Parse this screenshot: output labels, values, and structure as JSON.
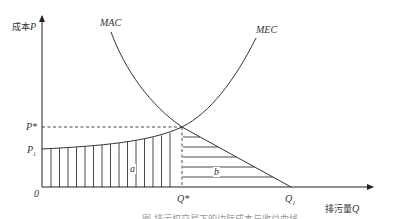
{
  "diagram": {
    "type": "economics-curves",
    "y_axis": {
      "label_cn": "成本",
      "label_var": "P"
    },
    "x_axis": {
      "label_cn": "排污量",
      "label_var": "Q"
    },
    "curves": [
      {
        "name": "MAC",
        "description": "marginal abatement cost, downward sloping"
      },
      {
        "name": "MEC",
        "description": "marginal external cost, upward sloping"
      }
    ],
    "points": {
      "origin": "0",
      "p_star": "P*",
      "p_one": "P",
      "p_one_sub": "1",
      "q_star": "Q*",
      "q_one": "Q",
      "q_one_sub": "1"
    },
    "regions": [
      {
        "name": "a",
        "hatch": "vertical",
        "description": "area under MEC from 0 to Q*"
      },
      {
        "name": "b",
        "hatch": "horizontal",
        "description": "area under MAC from Q* to Q1"
      }
    ],
    "caption": "图 排污权交易下的边际成本与收益曲线",
    "colors": {
      "line": "#333333",
      "text": "#333333",
      "background": "#ffffff"
    }
  }
}
